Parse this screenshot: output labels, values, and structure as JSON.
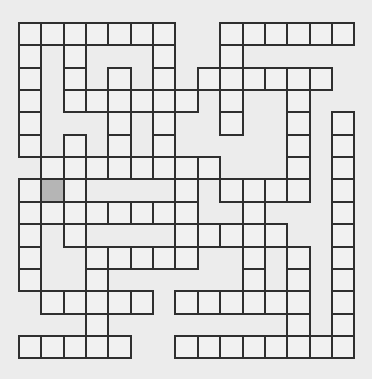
{
  "puzzle": {
    "type": "crossword",
    "rows": 15,
    "cols": 15,
    "colors": {
      "background": "#ececec",
      "cell": "#f1f1f1",
      "border": "#2f2f2f",
      "highlight": "#b5b5b5"
    },
    "selected_cell": {
      "row": 7,
      "col": 1
    },
    "white_cells_by_row": [
      [
        0,
        1,
        2,
        3,
        4,
        5,
        6,
        9,
        10,
        11,
        12,
        13,
        14
      ],
      [
        0,
        2,
        6,
        9
      ],
      [
        0,
        2,
        4,
        6,
        8,
        9,
        10,
        11,
        12,
        13
      ],
      [
        0,
        2,
        3,
        4,
        5,
        6,
        7,
        9,
        12
      ],
      [
        0,
        4,
        6,
        9,
        12,
        14
      ],
      [
        0,
        2,
        4,
        6,
        12,
        14
      ],
      [
        1,
        2,
        3,
        4,
        5,
        6,
        7,
        8,
        12,
        14
      ],
      [
        0,
        1,
        2,
        7,
        9,
        10,
        11,
        12,
        14
      ],
      [
        0,
        1,
        2,
        3,
        4,
        5,
        6,
        7,
        10,
        14
      ],
      [
        0,
        2,
        7,
        8,
        9,
        10,
        11,
        14
      ],
      [
        0,
        3,
        4,
        5,
        6,
        7,
        10,
        12,
        14
      ],
      [
        0,
        3,
        10,
        12,
        14
      ],
      [
        1,
        2,
        3,
        4,
        5,
        7,
        8,
        9,
        10,
        11,
        12,
        14
      ],
      [
        3,
        12,
        14
      ],
      [
        0,
        1,
        2,
        3,
        4,
        7,
        8,
        9,
        10,
        11,
        12,
        13,
        14
      ]
    ]
  }
}
